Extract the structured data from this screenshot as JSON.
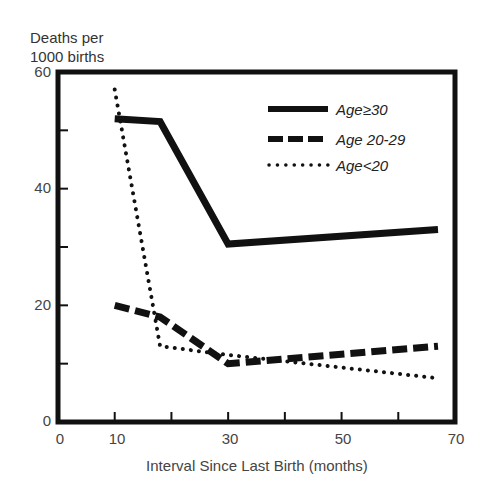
{
  "chart_data": {
    "type": "line",
    "title": "",
    "ylabel": "Deaths per 1000 births",
    "ylabel_lines": [
      "Deaths per",
      "1000 births"
    ],
    "xlabel": "Interval Since Last Birth (months)",
    "xlim": [
      0,
      70
    ],
    "ylim": [
      0,
      60
    ],
    "x_tick_labels": [
      "0",
      "10",
      "30",
      "50",
      "70"
    ],
    "x_ticks": [
      0,
      10,
      20,
      30,
      40,
      50,
      60,
      70
    ],
    "y_tick_labels": [
      "0",
      "20",
      "40",
      "60"
    ],
    "y_ticks": [
      0,
      10,
      20,
      30,
      40,
      50,
      60
    ],
    "grid": false,
    "legend_position": "upper right",
    "series": [
      {
        "name": "Age≥30",
        "style": "solid",
        "x": [
          10,
          18,
          30,
          67
        ],
        "values": [
          52,
          51.5,
          30.5,
          33
        ]
      },
      {
        "name": "Age 20-29",
        "style": "dashed",
        "x": [
          10,
          18,
          30,
          67
        ],
        "values": [
          20,
          18,
          10,
          13
        ]
      },
      {
        "name": "Age<20",
        "style": "dotted",
        "x": [
          10,
          18,
          30,
          67
        ],
        "values": [
          57,
          13,
          11.5,
          7.5
        ]
      }
    ]
  }
}
